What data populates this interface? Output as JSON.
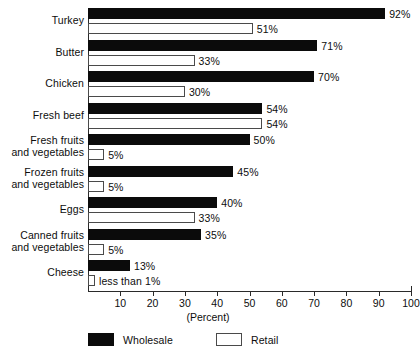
{
  "chart_data": {
    "type": "bar",
    "orientation": "horizontal",
    "title": "",
    "xlabel": "(Percent)",
    "ylabel": "",
    "xlim": [
      0,
      100
    ],
    "xticks": [
      10,
      20,
      30,
      40,
      50,
      60,
      70,
      80,
      90,
      100
    ],
    "grid": false,
    "legend_position": "bottom",
    "categories": [
      "Turkey",
      "Butter",
      "Chicken",
      "Fresh beef",
      "Fresh fruits and vegetables",
      "Frozen fruits and vegetables",
      "Eggs",
      "Canned fruits and vegetables",
      "Cheese"
    ],
    "series": [
      {
        "name": "Wholesale",
        "color": "#0b0b0b",
        "values": [
          92,
          71,
          70,
          54,
          50,
          45,
          40,
          35,
          13
        ],
        "labels": [
          "92%",
          "71%",
          "70%",
          "54%",
          "50%",
          "45%",
          "40%",
          "35%",
          "13%"
        ]
      },
      {
        "name": "Retail",
        "color": "#ffffff",
        "values": [
          51,
          33,
          30,
          54,
          5,
          5,
          33,
          5,
          0.5
        ],
        "labels": [
          "51%",
          "33%",
          "30%",
          "54%",
          "5%",
          "5%",
          "33%",
          "5%",
          "less than 1%"
        ]
      }
    ]
  },
  "labels": {
    "categories": [
      {
        "line1": "Turkey",
        "line2": ""
      },
      {
        "line1": "Butter",
        "line2": ""
      },
      {
        "line1": "Chicken",
        "line2": ""
      },
      {
        "line1": "Fresh beef",
        "line2": ""
      },
      {
        "line1": "Fresh fruits",
        "line2": "and vegetables"
      },
      {
        "line1": "Frozen fruits",
        "line2": "and vegetables"
      },
      {
        "line1": "Eggs",
        "line2": ""
      },
      {
        "line1": "Canned fruits",
        "line2": "and vegetables"
      },
      {
        "line1": "Cheese",
        "line2": ""
      }
    ]
  },
  "axis": {
    "title": "(Percent)",
    "ticks": [
      "10",
      "20",
      "30",
      "40",
      "50",
      "60",
      "70",
      "80",
      "90",
      "100"
    ]
  },
  "legend": {
    "items": [
      {
        "label": "Wholesale",
        "swatch": "black"
      },
      {
        "label": "Retail",
        "swatch": "white"
      }
    ]
  }
}
